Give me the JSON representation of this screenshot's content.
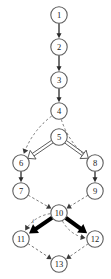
{
  "diagram": {
    "kind": "directed-graph",
    "canvas": {
      "width": 111,
      "height": 279,
      "background": "#ffffff"
    },
    "colors": {
      "node_fill": "#ffffff",
      "node_stroke": "#5d5d5d",
      "node_label": "#1a1a1a",
      "edge_solid": "#2b2b2b",
      "edge_dashed": "#6a6a6a",
      "edge_thick": "#000000",
      "edge_double": "#4a4a4a"
    },
    "node_radius": 8.2,
    "nodes": [
      {
        "id": "n1",
        "label": "1",
        "x": 59,
        "y": 15
      },
      {
        "id": "n2",
        "label": "2",
        "x": 59,
        "y": 47
      },
      {
        "id": "n3",
        "label": "3",
        "x": 59,
        "y": 80
      },
      {
        "id": "n4",
        "label": "4",
        "x": 59,
        "y": 111
      },
      {
        "id": "n5",
        "label": "5",
        "x": 59,
        "y": 137
      },
      {
        "id": "n6",
        "label": "6",
        "x": 21,
        "y": 163
      },
      {
        "id": "n7",
        "label": "7",
        "x": 21,
        "y": 191
      },
      {
        "id": "n8",
        "label": "8",
        "x": 95,
        "y": 163
      },
      {
        "id": "n9",
        "label": "9",
        "x": 95,
        "y": 191
      },
      {
        "id": "n10",
        "label": "10",
        "x": 59,
        "y": 213
      },
      {
        "id": "n11",
        "label": "11",
        "x": 21,
        "y": 239
      },
      {
        "id": "n12",
        "label": "12",
        "x": 95,
        "y": 239
      },
      {
        "id": "n13",
        "label": "13",
        "x": 59,
        "y": 264
      }
    ],
    "edges": [
      {
        "id": "e1",
        "from": "n1",
        "to": "n2",
        "style": "solid",
        "shape": "straight"
      },
      {
        "id": "e2",
        "from": "n2",
        "to": "n3",
        "style": "solid",
        "shape": "straight"
      },
      {
        "id": "e3",
        "from": "n3",
        "to": "n4",
        "style": "solid",
        "shape": "straight"
      },
      {
        "id": "e4",
        "from": "n4",
        "to": "n6",
        "style": "dashed",
        "shape": "curve-left"
      },
      {
        "id": "e5",
        "from": "n4",
        "to": "n8",
        "style": "dashed",
        "shape": "curve-right"
      },
      {
        "id": "e6",
        "from": "n5",
        "to": "n6",
        "style": "double",
        "shape": "straight"
      },
      {
        "id": "e7",
        "from": "n5",
        "to": "n8",
        "style": "double",
        "shape": "straight"
      },
      {
        "id": "e8",
        "from": "n6",
        "to": "n7",
        "style": "solid",
        "shape": "straight"
      },
      {
        "id": "e9",
        "from": "n8",
        "to": "n9",
        "style": "solid",
        "shape": "straight"
      },
      {
        "id": "e10",
        "from": "n7",
        "to": "n10",
        "style": "dashed",
        "shape": "straight"
      },
      {
        "id": "e11",
        "from": "n9",
        "to": "n10",
        "style": "dashed",
        "shape": "straight"
      },
      {
        "id": "e12",
        "from": "n10",
        "to": "n11",
        "style": "thick",
        "shape": "straight"
      },
      {
        "id": "e13",
        "from": "n10",
        "to": "n12",
        "style": "thick",
        "shape": "straight"
      },
      {
        "id": "e14",
        "from": "n10",
        "to": "n11",
        "style": "dashed",
        "shape": "arc-above-left",
        "label": "i"
      },
      {
        "id": "e15",
        "from": "n10",
        "to": "n12",
        "style": "dashed",
        "shape": "arc-above-right"
      },
      {
        "id": "e16",
        "from": "n11",
        "to": "n13",
        "style": "dashed",
        "shape": "straight"
      },
      {
        "id": "e17",
        "from": "n12",
        "to": "n13",
        "style": "dashed",
        "shape": "straight"
      }
    ],
    "edge_labels": [
      {
        "id": "lbl-i",
        "text": "i",
        "x": 33,
        "y": 221
      }
    ]
  }
}
